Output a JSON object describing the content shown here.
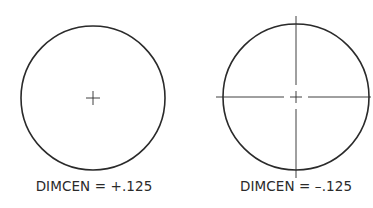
{
  "figures": [
    {
      "id": "left",
      "label": "DIMCEN = +.125",
      "mark_type": "center-mark-only",
      "circle": {
        "cx": 93,
        "cy": 98,
        "r": 72
      },
      "center_mark_size": 7
    },
    {
      "id": "right",
      "label": "DIMCEN = –.125",
      "mark_type": "center-mark-with-centerlines",
      "circle": {
        "cx": 296,
        "cy": 97,
        "r": 73
      },
      "center_mark_size": 6,
      "centerline_gap": 5,
      "centerline_extension": 8
    }
  ],
  "colors": {
    "stroke": "#2a2a2a",
    "background": "#ffffff"
  }
}
